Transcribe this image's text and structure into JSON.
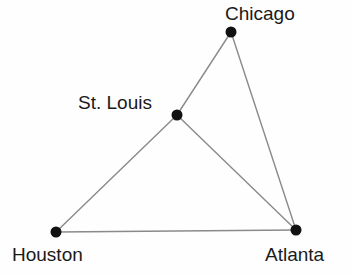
{
  "diagram": {
    "type": "node-link-graph",
    "title": "",
    "background_color": "#fefefe",
    "node_color": "#111111",
    "edge_color": "#8a8a8a",
    "label_color": "#1a1a1a",
    "nodes": [
      {
        "id": "chicago",
        "label": "Chicago",
        "x": 231,
        "y": 32,
        "radius": 5.5,
        "label_x": 225,
        "label_y": 4,
        "label_anchor": "above-right"
      },
      {
        "id": "st-louis",
        "label": "St. Louis",
        "x": 177,
        "y": 115,
        "radius": 5.5,
        "label_x": 78,
        "label_y": 93,
        "label_anchor": "left"
      },
      {
        "id": "houston",
        "label": "Houston",
        "x": 56,
        "y": 232,
        "radius": 5.5,
        "label_x": 12,
        "label_y": 245,
        "label_anchor": "below"
      },
      {
        "id": "atlanta",
        "label": "Atlanta",
        "x": 296,
        "y": 230,
        "radius": 5.5,
        "label_x": 265,
        "label_y": 245,
        "label_anchor": "below"
      }
    ],
    "edges": [
      {
        "id": "chicago-st-louis",
        "from": "chicago",
        "to": "st-louis"
      },
      {
        "id": "chicago-atlanta",
        "from": "chicago",
        "to": "atlanta"
      },
      {
        "id": "st-louis-atlanta",
        "from": "st-louis",
        "to": "atlanta"
      },
      {
        "id": "st-louis-houston",
        "from": "st-louis",
        "to": "houston"
      },
      {
        "id": "houston-atlanta",
        "from": "houston",
        "to": "atlanta"
      }
    ]
  }
}
